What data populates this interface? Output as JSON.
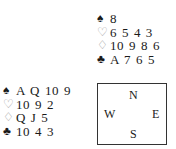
{
  "hands": {
    "north": [
      {
        "suit": "spades",
        "symbol": "♠",
        "cards": "8"
      },
      {
        "suit": "hearts",
        "symbol": "♡",
        "cards": "6 5 4 3"
      },
      {
        "suit": "diamonds",
        "symbol": "♢",
        "cards": "10 9 8 6"
      },
      {
        "suit": "clubs",
        "symbol": "♣",
        "cards": "A 7 6 5"
      }
    ],
    "west": [
      {
        "suit": "spades",
        "symbol": "♠",
        "cards": "A Q 10 9"
      },
      {
        "suit": "hearts",
        "symbol": "♡",
        "cards": "10 9 2"
      },
      {
        "suit": "diamonds",
        "symbol": "♢",
        "cards": "Q J 5"
      },
      {
        "suit": "clubs",
        "symbol": "♣",
        "cards": "10 4 3"
      }
    ]
  },
  "compass": {
    "north": "N",
    "west": "W",
    "east": "E",
    "south": "S"
  }
}
